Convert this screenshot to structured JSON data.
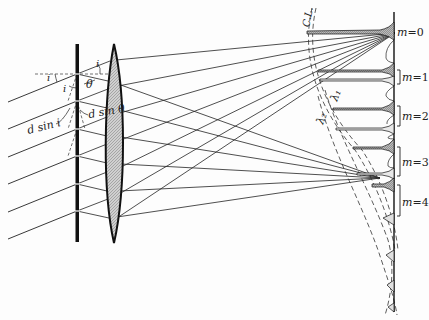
{
  "figure": {
    "type": "diffraction-grating-diagram",
    "labels": {
      "incidence_angle_top": "i",
      "incidence_angle_left": "i",
      "incidence_angle_inner": "i",
      "diffraction_angle": "θ",
      "path_diff_incident": "d sin i",
      "path_diff_diffracted": "d sin θ",
      "focal_curve": "C.L.",
      "wavelength_1": "λ₁",
      "wavelength_2": "λ₂"
    },
    "orders": [
      {
        "label": "m = 0",
        "m": "m",
        "eq": "=0"
      },
      {
        "label": "m = 1",
        "m": "m",
        "eq": "=1"
      },
      {
        "label": "m = 2",
        "m": "m",
        "eq": "=2"
      },
      {
        "label": "m = 3",
        "m": "m",
        "eq": "=3"
      },
      {
        "label": "m = 4",
        "m": "m",
        "eq": "=4"
      }
    ],
    "colors": {
      "ink": "#111111",
      "lens_fill": "#c8c8c8",
      "peak_fill": "#bdbdbd",
      "background": "#fdfdfd"
    }
  }
}
